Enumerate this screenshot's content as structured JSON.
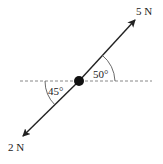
{
  "diagram": {
    "forces": [
      {
        "label": "5 N",
        "magnitude": 5,
        "unit": "N",
        "direction": "up-right",
        "angle_label": "50°",
        "angle_deg": 50
      },
      {
        "label": "2 N",
        "magnitude": 2,
        "unit": "N",
        "direction": "down-left",
        "angle_label": "45°",
        "angle_deg": 45
      }
    ],
    "reference_line": "horizontal dashed",
    "colors": {
      "line": "#222222",
      "dashed": "#888888",
      "dot": "#111111"
    }
  }
}
